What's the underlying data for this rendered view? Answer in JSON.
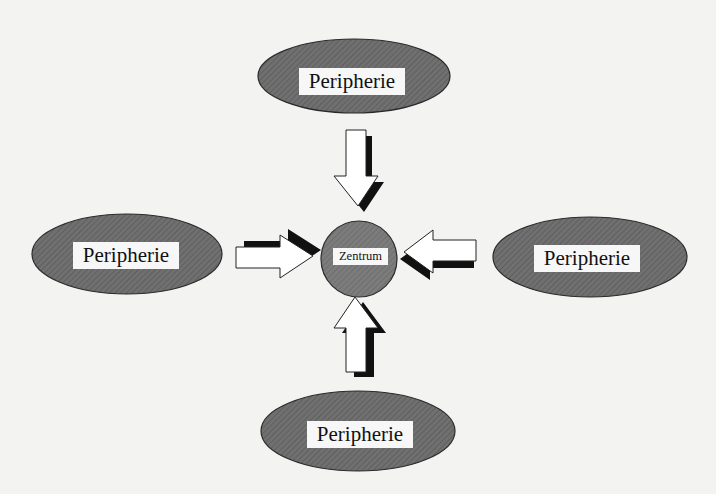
{
  "diagram": {
    "type": "center-periphery",
    "center": {
      "label": "Zentrum",
      "shape": "circle",
      "fill": "#7a7a7a"
    },
    "periphery_nodes": [
      {
        "position": "top",
        "label": "Peripherie",
        "shape": "ellipse"
      },
      {
        "position": "left",
        "label": "Peripherie",
        "shape": "ellipse"
      },
      {
        "position": "right",
        "label": "Peripherie",
        "shape": "ellipse"
      },
      {
        "position": "bottom",
        "label": "Peripherie",
        "shape": "ellipse"
      }
    ],
    "edges": [
      {
        "from": "top",
        "to": "center",
        "style": "hollow-block-arrow-with-shadow"
      },
      {
        "from": "left",
        "to": "center",
        "style": "hollow-block-arrow-with-shadow"
      },
      {
        "from": "right",
        "to": "center",
        "style": "hollow-block-arrow-with-shadow"
      },
      {
        "from": "bottom",
        "to": "center",
        "style": "hollow-block-arrow-with-shadow"
      }
    ],
    "colors": {
      "background": "#f3f3f2",
      "node_fill": "#6e6e6e",
      "center_fill": "#7a7a7a",
      "label_background": "#f7f7f7",
      "arrow_fill": "#ffffff",
      "arrow_shadow": "#111111",
      "outline": "#222222"
    }
  }
}
